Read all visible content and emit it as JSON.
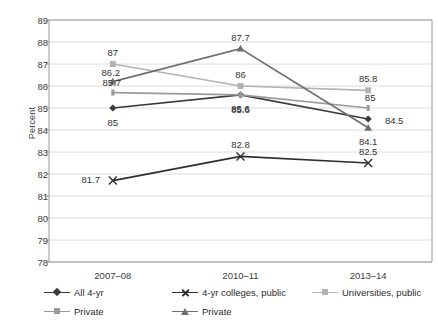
{
  "chart_data": {
    "type": "line",
    "title": "",
    "xlabel": "",
    "ylabel": "Percent",
    "categories": [
      "2007–08",
      "2010–11",
      "2013–14"
    ],
    "ylim": [
      78,
      89
    ],
    "ytick_step": 1,
    "yticks": [
      "89",
      "88",
      "87",
      "86",
      "85",
      "84",
      "83",
      "82",
      "81",
      "80",
      "79",
      "78"
    ],
    "grid": "horizontal",
    "legend_position": "bottom",
    "series": [
      {
        "name": "All 4-yr",
        "marker": "diamond",
        "color": "#3a3a3a",
        "values": [
          85,
          85.6,
          84.5
        ],
        "labels": [
          "85",
          "85.6",
          "84.5"
        ]
      },
      {
        "name": "4-yr colleges, public",
        "marker": "cross",
        "color": "#2e2e2e",
        "values": [
          81.7,
          82.8,
          82.5
        ],
        "labels": [
          "81.7",
          "82.8",
          "82.5"
        ]
      },
      {
        "name": "Universities, public",
        "marker": "square",
        "color": "#b3b3b3",
        "values": [
          87,
          86,
          85.8
        ],
        "labels": [
          "87",
          "86",
          "85.8"
        ]
      },
      {
        "name": "Private",
        "marker": "line",
        "color": "#9a9a9a",
        "values": [
          85.7,
          85.6,
          85
        ],
        "labels": [
          "85.7",
          "85.6",
          "85"
        ]
      },
      {
        "name": "Private",
        "marker": "triangle",
        "color": "#6e6e6e",
        "values": [
          86.2,
          87.7,
          84.1
        ],
        "labels": [
          "86.2",
          "87.7",
          "84.1"
        ]
      }
    ]
  },
  "axis": {
    "y_title": "Percent"
  },
  "legend": {
    "items": [
      {
        "label": "All 4-yr"
      },
      {
        "label": "4-yr colleges, public"
      },
      {
        "label": "Universities, public"
      },
      {
        "label": "Private"
      },
      {
        "label": "Private"
      }
    ]
  }
}
